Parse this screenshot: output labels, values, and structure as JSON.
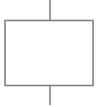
{
  "diagram": {
    "type": "block",
    "nodes": [
      {
        "id": "block",
        "shape": "rectangle",
        "label": ""
      }
    ],
    "edges": [
      {
        "id": "input-lead",
        "to": "block",
        "direction": "from-top"
      },
      {
        "id": "output-lead",
        "from": "block",
        "direction": "to-bottom"
      }
    ],
    "colors": {
      "stroke": "#7a7a7a",
      "fill": "#ffffff",
      "background": "#ffffff"
    }
  }
}
